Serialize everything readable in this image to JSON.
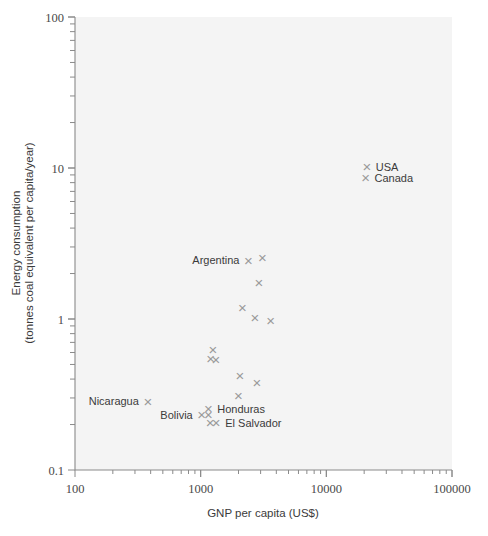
{
  "chart_data": {
    "type": "scatter",
    "title": "",
    "xlabel": "GNP per capita (US$)",
    "ylabel": "Energy consumption\n(tonnes coal equivalent per capita/year)",
    "ylabel_line1": "Energy consumption",
    "ylabel_line2": "(tonnes coal equivalent per capita/year)",
    "xscale": "log",
    "yscale": "log",
    "xlim": [
      100,
      100000
    ],
    "ylim": [
      0.1,
      100
    ],
    "grid": false,
    "legend": "none",
    "marker": "x",
    "marker_color": "#9a9a9a",
    "xticks": [
      "100",
      "1000",
      "10000",
      "100000"
    ],
    "xtick_values": [
      100,
      1000,
      10000,
      100000
    ],
    "yticks": [
      "0.1",
      "1",
      "10",
      "100"
    ],
    "ytick_values": [
      0.1,
      1,
      10,
      100
    ],
    "points": [
      {
        "label": "USA",
        "x": 21000,
        "y": 10.2,
        "label_pos": "right"
      },
      {
        "label": "Canada",
        "x": 20500,
        "y": 8.6,
        "label_pos": "right"
      },
      {
        "label": "Argentina",
        "x": 2400,
        "y": 2.45,
        "label_pos": "left"
      },
      {
        "label": "",
        "x": 3100,
        "y": 2.55,
        "label_pos": "none"
      },
      {
        "label": "",
        "x": 2900,
        "y": 1.75,
        "label_pos": "none"
      },
      {
        "label": "",
        "x": 2150,
        "y": 1.2,
        "label_pos": "none"
      },
      {
        "label": "",
        "x": 2700,
        "y": 1.02,
        "label_pos": "none"
      },
      {
        "label": "",
        "x": 3600,
        "y": 0.98,
        "label_pos": "none"
      },
      {
        "label": "",
        "x": 1250,
        "y": 0.63,
        "label_pos": "none"
      },
      {
        "label": "",
        "x": 1200,
        "y": 0.55,
        "label_pos": "none"
      },
      {
        "label": "",
        "x": 1320,
        "y": 0.54,
        "label_pos": "none"
      },
      {
        "label": "",
        "x": 2050,
        "y": 0.42,
        "label_pos": "none"
      },
      {
        "label": "",
        "x": 2800,
        "y": 0.38,
        "label_pos": "none"
      },
      {
        "label": "",
        "x": 2000,
        "y": 0.31,
        "label_pos": "none"
      },
      {
        "label": "Nicaragua",
        "x": 380,
        "y": 0.285,
        "label_pos": "left"
      },
      {
        "label": "Honduras",
        "x": 1150,
        "y": 0.255,
        "label_pos": "right"
      },
      {
        "label": "Bolivia",
        "x": 1020,
        "y": 0.232,
        "label_pos": "left"
      },
      {
        "label": "",
        "x": 1150,
        "y": 0.232,
        "label_pos": "none"
      },
      {
        "label": "El Salvador",
        "x": 1330,
        "y": 0.205,
        "label_pos": "right"
      },
      {
        "label": "",
        "x": 1190,
        "y": 0.205,
        "label_pos": "none"
      }
    ]
  }
}
